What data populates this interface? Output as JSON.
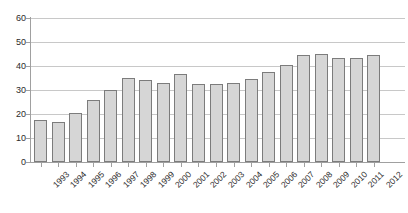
{
  "chart_data": {
    "type": "bar",
    "title": "",
    "subtitle": "",
    "xlabel": "",
    "ylabel": "",
    "ylim": [
      0,
      60
    ],
    "yticks": [
      0,
      10,
      20,
      30,
      40,
      50,
      60
    ],
    "grid": true,
    "legend": false,
    "legend_position": "none",
    "categories": [
      "1993",
      "1994",
      "1995",
      "1996",
      "1997",
      "1998",
      "1999",
      "2000",
      "2001",
      "2002",
      "2003",
      "2004",
      "2005",
      "2006",
      "2007",
      "2008",
      "2009",
      "2010",
      "2011",
      "2012"
    ],
    "values": [
      17.5,
      16.5,
      20.5,
      26,
      30,
      35,
      34,
      33,
      36.5,
      32.5,
      32.5,
      33,
      34.5,
      37.5,
      40.5,
      44.5,
      45,
      43.5,
      43.5,
      44.5
    ],
    "series": [
      {
        "name": "",
        "values": [
          17.5,
          16.5,
          20.5,
          26,
          30,
          35,
          34,
          33,
          36.5,
          32.5,
          32.5,
          33,
          34.5,
          37.5,
          40.5,
          44.5,
          45,
          43.5,
          43.5,
          44.5
        ]
      }
    ]
  },
  "style": {
    "bar_fill": "#d6d6d6",
    "bar_border": "#7c7c7c",
    "gridline_color": "#c8c8c8",
    "axis_color": "#a0a0a0",
    "text_color": "#2b2b2b",
    "background": "#ffffff"
  }
}
